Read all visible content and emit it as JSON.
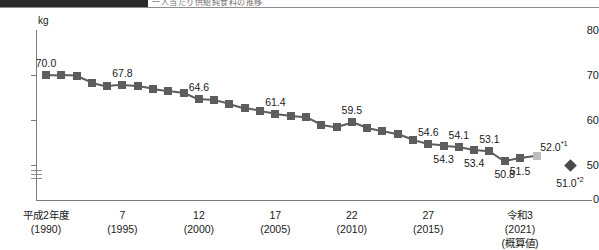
{
  "top_strip": {
    "partial_text": "一人当たり供給純食料の推移"
  },
  "chart_data": {
    "type": "line",
    "title": "",
    "subtitle": "",
    "xlabel": "",
    "ylabel": "kg",
    "unit_label": "kg",
    "ylim": [
      40,
      80
    ],
    "yticks": [
      "80",
      "70",
      "60",
      "50",
      "0"
    ],
    "axis_break": true,
    "grid": false,
    "legend": "none",
    "x_tick_labels": [
      {
        "line1": "平成2年度",
        "line2": "(1990)",
        "line3": ""
      },
      {
        "line1": "7",
        "line2": "(1995)",
        "line3": ""
      },
      {
        "line1": "12",
        "line2": "(2000)",
        "line3": ""
      },
      {
        "line1": "17",
        "line2": "(2005)",
        "line3": ""
      },
      {
        "line1": "22",
        "line2": "(2010)",
        "line3": ""
      },
      {
        "line1": "27",
        "line2": "(2015)",
        "line3": ""
      },
      {
        "line1": "令和3",
        "line2": "(2021)",
        "line3": "(概算値)"
      }
    ],
    "x": [
      1990,
      1991,
      1992,
      1993,
      1994,
      1995,
      1996,
      1997,
      1998,
      1999,
      2000,
      2001,
      2002,
      2003,
      2004,
      2005,
      2006,
      2007,
      2008,
      2009,
      2010,
      2011,
      2012,
      2013,
      2014,
      2015,
      2016,
      2017,
      2018,
      2019,
      2020,
      2021
    ],
    "values": [
      70.0,
      69.9,
      69.8,
      68.3,
      67.5,
      67.8,
      67.6,
      67.0,
      66.5,
      66.1,
      64.6,
      64.4,
      63.6,
      62.6,
      62.0,
      61.4,
      61.0,
      60.7,
      59.0,
      58.5,
      59.5,
      58.2,
      57.5,
      56.8,
      55.5,
      54.6,
      54.3,
      54.1,
      53.4,
      53.1,
      50.8,
      51.5
    ],
    "labeled_points": [
      {
        "x": 1990,
        "value": "70.0",
        "position": "above"
      },
      {
        "x": 1995,
        "value": "67.8",
        "position": "above"
      },
      {
        "x": 2000,
        "value": "64.6",
        "position": "above"
      },
      {
        "x": 2005,
        "value": "61.4",
        "position": "above"
      },
      {
        "x": 2010,
        "value": "59.5",
        "position": "above"
      },
      {
        "x": 2015,
        "value": "54.6",
        "position": "above"
      },
      {
        "x": 2016,
        "value": "54.3",
        "position": "below"
      },
      {
        "x": 2017,
        "value": "54.1",
        "position": "above"
      },
      {
        "x": 2018,
        "value": "53.4",
        "position": "below"
      },
      {
        "x": 2019,
        "value": "53.1",
        "position": "above"
      },
      {
        "x": 2020,
        "value": "50.8",
        "position": "below"
      },
      {
        "x": 2021,
        "value": "51.5",
        "position": "below"
      }
    ],
    "extra_points": [
      {
        "name": "estimate-light-square",
        "value": "52.0",
        "footnote": "*1",
        "marker": "square-light",
        "color": "#bdbdbd"
      },
      {
        "name": "estimate-diamond",
        "value": "51.0",
        "footnote": "*2",
        "marker": "diamond",
        "color": "#4a4a4a"
      }
    ],
    "series_color": "#5d5d5d"
  }
}
